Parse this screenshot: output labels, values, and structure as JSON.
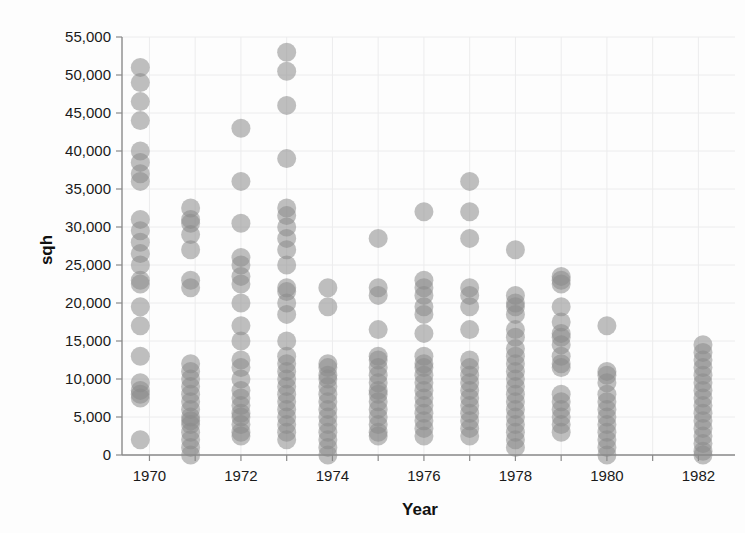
{
  "chart_data": {
    "type": "scatter",
    "title": "",
    "xlabel": "Year",
    "ylabel": "sqh",
    "xlim": [
      1969.4,
      1982.8
    ],
    "ylim": [
      0,
      55000
    ],
    "grid": true,
    "legend": null,
    "marker": {
      "shape": "circle",
      "color": "#8b8b8b",
      "opacity": 0.55,
      "size_px": 19
    },
    "x_ticks": [
      1970,
      1971,
      1972,
      1973,
      1974,
      1975,
      1976,
      1977,
      1978,
      1979,
      1980,
      1981,
      1982
    ],
    "x_tick_labels": [
      "1970",
      "",
      "1972",
      "",
      "1974",
      "",
      "1976",
      "",
      "1978",
      "",
      "1980",
      "",
      "1982"
    ],
    "y_ticks": [
      0,
      5000,
      10000,
      15000,
      20000,
      25000,
      30000,
      35000,
      40000,
      45000,
      50000,
      55000
    ],
    "y_tick_labels": [
      "0",
      "5,000",
      "10,000",
      "15,000",
      "20,000",
      "25,000",
      "30,000",
      "35,000",
      "40,000",
      "45,000",
      "50,000",
      "55,000"
    ],
    "series": [
      {
        "name": "sqh observations",
        "x": [
          1970,
          1972,
          1974,
          1976,
          1978,
          1980,
          1982
        ],
        "points_by_year": [
          {
            "year": 1969.8,
            "values": [
              51000,
              49000,
              46500,
              44000,
              40000,
              38500,
              37000,
              36000,
              31000,
              29500,
              28000,
              26500,
              25000,
              23000,
              22500,
              19500,
              17000,
              13000,
              9500,
              8500,
              8000,
              7500,
              2000
            ]
          },
          {
            "year": 1970.9,
            "values": [
              32500,
              31000,
              30500,
              29000,
              27000,
              23000,
              22000,
              12000,
              11000,
              10000,
              9000,
              8000,
              7000,
              6000,
              5000,
              4500,
              4000,
              3000,
              2000,
              1000,
              0
            ]
          },
          {
            "year": 1972.0,
            "values": [
              43000,
              36000,
              30500,
              26000,
              25000,
              23500,
              22500,
              20000,
              17000,
              15000,
              12500,
              11500,
              10000,
              8500,
              7500,
              6500,
              5500,
              5000,
              4000,
              3000,
              2500
            ]
          },
          {
            "year": 1973.0,
            "values": [
              53000,
              50500,
              46000,
              39000,
              32500,
              31500,
              30000,
              28500,
              27000,
              25000,
              22000,
              21500,
              20000,
              18500,
              15000,
              13000,
              12000,
              11000,
              10000,
              9000,
              8000,
              7000,
              6000,
              5000,
              4000,
              3000,
              2000
            ]
          },
          {
            "year": 1973.9,
            "values": [
              22000,
              19500,
              12000,
              11500,
              10500,
              10000,
              9000,
              8000,
              7000,
              6000,
              5000,
              4000,
              3000,
              2000,
              1000,
              0
            ]
          },
          {
            "year": 1975.0,
            "values": [
              28500,
              22000,
              21000,
              16500,
              13000,
              12500,
              11500,
              10500,
              9500,
              8500,
              8000,
              7000,
              6000,
              5000,
              4000,
              3000,
              2500
            ]
          },
          {
            "year": 1976.0,
            "values": [
              32000,
              23000,
              22000,
              21000,
              19500,
              18500,
              16000,
              13000,
              12000,
              11500,
              10500,
              9500,
              8500,
              7500,
              6500,
              5500,
              4500,
              3500,
              2500
            ]
          },
          {
            "year": 1977.0,
            "values": [
              36000,
              32000,
              28500,
              22000,
              21000,
              19500,
              16500,
              12500,
              11500,
              10500,
              9500,
              8500,
              7500,
              6500,
              5500,
              4500,
              3500,
              2500
            ]
          },
          {
            "year": 1978.0,
            "values": [
              27000,
              21000,
              20000,
              19500,
              18500,
              16500,
              15500,
              14000,
              13000,
              12000,
              11000,
              10000,
              9000,
              8000,
              7000,
              6000,
              5000,
              4000,
              3000,
              2000,
              1000
            ]
          },
          {
            "year": 1979.0,
            "values": [
              23500,
              23000,
              22500,
              19500,
              17500,
              16000,
              15500,
              14500,
              13000,
              12000,
              11500,
              8000,
              7000,
              6000,
              5000,
              4000,
              3000
            ]
          },
          {
            "year": 1980.0,
            "values": [
              17000,
              11000,
              10500,
              9500,
              8000,
              7000,
              6000,
              5000,
              4000,
              3000,
              2000,
              1000,
              0
            ]
          },
          {
            "year": 1982.1,
            "values": [
              14500,
              13500,
              12500,
              11500,
              10500,
              9500,
              8500,
              7500,
              6500,
              5500,
              4500,
              3500,
              2500,
              1500,
              500,
              0
            ]
          }
        ]
      }
    ],
    "summary": {
      "n_columns": 12,
      "max_value": 53000,
      "min_value": 0,
      "notes": "Dense stacked columns of semi-transparent gray circles; density concentrated below 15,000 sqh; maximum values decline across years."
    }
  },
  "axes": {
    "y_axis_label": "sqh",
    "x_axis_label": "Year"
  }
}
